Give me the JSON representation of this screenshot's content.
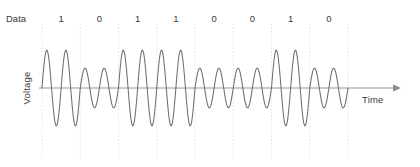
{
  "figure": {
    "row_label": "Data",
    "y_axis_label": "Voltage",
    "x_axis_label": "Time"
  },
  "colors": {
    "background": "#ffffff",
    "waveform": "#6e6e6e",
    "axis": "#8a8a8a",
    "gridline": "#d9d9d9",
    "text": "#3a3a3a"
  },
  "chart_data": {
    "type": "line",
    "title": "",
    "subtitle": "",
    "xlabel": "Time",
    "ylabel": "Voltage",
    "grid": true,
    "legend_position": "none",
    "modulation": "ASK",
    "categories": [
      "1",
      "0",
      "1",
      "1",
      "0",
      "0",
      "1",
      "0"
    ],
    "bits": [
      1,
      0,
      1,
      1,
      0,
      0,
      1,
      0
    ],
    "bit_labels": [
      "1",
      "0",
      "1",
      "1",
      "0",
      "0",
      "1",
      "0"
    ],
    "annotations": [
      "Data",
      "Voltage",
      "Time"
    ],
    "cycles_per_bit": 2,
    "amplitude_high": 38,
    "amplitude_low": 20,
    "values": [
      38,
      20,
      38,
      38,
      20,
      20,
      38,
      20
    ],
    "xlim": [
      0,
      8
    ],
    "ylim": [
      -38,
      38
    ],
    "x_tick_labels": [
      "",
      "",
      "",
      "",
      "",
      "",
      "",
      "",
      ""
    ],
    "y_tick_labels": []
  },
  "geometry": {
    "plot_left": 42,
    "plot_right": 348,
    "baseline_y": 88,
    "grid_top": 24,
    "grid_bottom": 158,
    "bit_width": 38.25,
    "bit_label_y": 22,
    "row_label_x": 6,
    "axis_arrow_x": 400,
    "time_label_x": 362,
    "time_label_y": 103,
    "voltage_label_x": 30,
    "voltage_label_y": 88
  }
}
